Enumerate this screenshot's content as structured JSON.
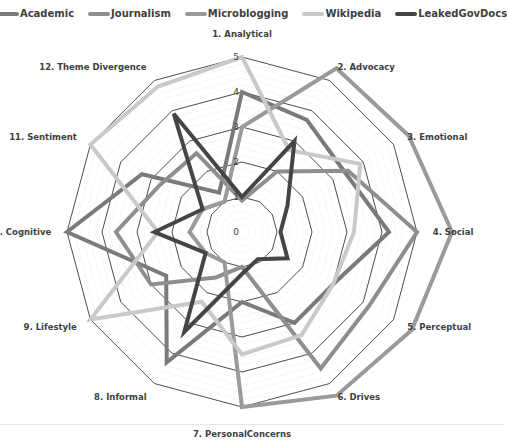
{
  "chart_data": {
    "type": "radar",
    "title": "",
    "axes": [
      "1. Analytical",
      "2. Advocacy",
      "3. Emotional",
      "4. Social",
      "5. Perceptual",
      "6. Drives",
      "7. PersonalConcerns",
      "8. Informal",
      "9. Lifestyle",
      "10. Cognitive",
      "11. Sentiment",
      "12. Theme Divergence"
    ],
    "tick_labels": [
      "0",
      "1",
      "2",
      "3",
      "4",
      "5"
    ],
    "rlim": [
      0,
      5
    ],
    "grid": true,
    "legend_position": "top",
    "series": [
      {
        "name": "Academic",
        "color": "#7a7a7a",
        "values": [
          4,
          3.7,
          3.4,
          4.2,
          3.0,
          3.0,
          2.0,
          4.3,
          2.5,
          5.0,
          3.3,
          1.3
        ]
      },
      {
        "name": "Journalism",
        "color": "#8e8e8e",
        "values": [
          0.9,
          2.0,
          3.5,
          5.0,
          4.2,
          4.5,
          1.0,
          1.5,
          3.0,
          3.6,
          2.7,
          2.6
        ]
      },
      {
        "name": "Microblogging",
        "color": "#9a9a9a",
        "values": [
          3.0,
          5.4,
          5.5,
          6.0,
          5.6,
          5.4,
          5.0,
          1.0,
          1.2,
          1.5,
          1.3,
          1.0
        ]
      },
      {
        "name": "Wikipedia",
        "color": "#c9c9c9",
        "values": [
          5.0,
          2.7,
          3.9,
          3.2,
          3.0,
          3.4,
          3.5,
          2.3,
          5.0,
          2.4,
          5.0,
          4.8
        ]
      },
      {
        "name": "LeakedGovDocs",
        "color": "#454545",
        "values": [
          1.0,
          3.0,
          1.5,
          1.1,
          1.5,
          0.9,
          1.2,
          3.3,
          1.2,
          2.5,
          1.3,
          3.9
        ]
      }
    ]
  },
  "legend": {
    "items": [
      {
        "label": "Academic",
        "color": "#7a7a7a"
      },
      {
        "label": "Journalism",
        "color": "#8e8e8e"
      },
      {
        "label": "Microblogging",
        "color": "#9a9a9a"
      },
      {
        "label": "Wikipedia",
        "color": "#c9c9c9"
      },
      {
        "label": "LeakedGovDocs",
        "color": "#454545"
      }
    ]
  }
}
